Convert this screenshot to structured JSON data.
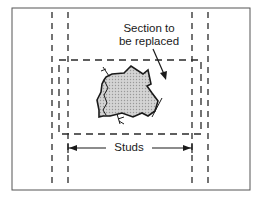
{
  "diagram": {
    "labels": {
      "section": "Section to be replaced",
      "section_line1": "Section to",
      "section_line2": "be replaced",
      "studs": "Studs"
    },
    "colors": {
      "line": "#2a2a2a",
      "patch_fill": "#c8c8c8",
      "border": "#555555"
    },
    "elements": [
      "outer-frame",
      "stud-lines-left",
      "stud-lines-right",
      "replacement-section-outline",
      "damaged-area",
      "studs-dimension-arrow",
      "callout-arrow"
    ]
  }
}
